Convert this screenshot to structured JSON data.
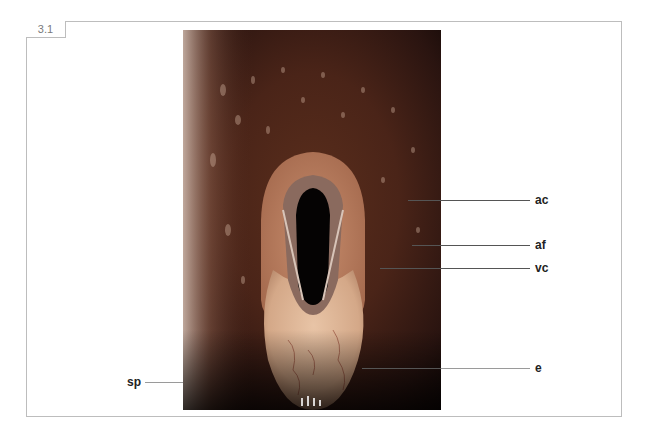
{
  "figure": {
    "number": "3.1",
    "image_description": "Endoscopic view of the larynx",
    "colors": {
      "frame_border": "#bdbdbd",
      "tab_text": "#7a7a7a",
      "label_text": "#222222",
      "leader_line": "#555555"
    }
  },
  "labels": [
    {
      "id": "ac",
      "text": "ac"
    },
    {
      "id": "af",
      "text": "af"
    },
    {
      "id": "vc",
      "text": "vc"
    },
    {
      "id": "e",
      "text": "e"
    },
    {
      "id": "sp",
      "text": "sp"
    }
  ]
}
